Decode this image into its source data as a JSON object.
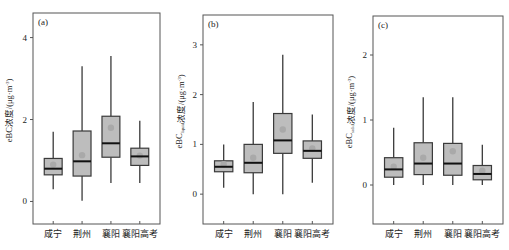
{
  "chart_data": [
    {
      "type": "box",
      "panel_label": "(a)",
      "title": "",
      "xlabel": "",
      "ylabel": "eBC浓度/(μg·m⁻³)",
      "ylabel_main": "eBC",
      "ylabel_sub": "",
      "ylabel_rest": "浓度/(μg·m",
      "ylabel_sup": "-3",
      "ylabel_close": ")",
      "categories": [
        "咸宁",
        "荆州",
        "襄阳",
        "襄阳高考"
      ],
      "yticks": [
        0,
        2,
        4
      ],
      "ylim": [
        -0.55,
        4.6
      ],
      "grid": false,
      "legend": null,
      "boxes": [
        {
          "name": "咸宁",
          "whisker_low": 0.3,
          "q1": 0.65,
          "median": 0.8,
          "q3": 1.05,
          "whisker_high": 1.7,
          "mean": 0.9
        },
        {
          "name": "荆州",
          "whisker_low": 0.02,
          "q1": 0.62,
          "median": 0.98,
          "q3": 1.72,
          "whisker_high": 3.3,
          "mean": 1.13
        },
        {
          "name": "襄阳",
          "whisker_low": 0.45,
          "q1": 1.08,
          "median": 1.42,
          "q3": 2.08,
          "whisker_high": 3.55,
          "mean": 1.8
        },
        {
          "name": "襄阳高考",
          "whisker_low": 0.45,
          "q1": 0.88,
          "median": 1.1,
          "q3": 1.3,
          "whisker_high": 1.97,
          "mean": 1.12
        }
      ]
    },
    {
      "type": "box",
      "panel_label": "(b)",
      "title": "",
      "xlabel": "",
      "ylabel": "eBC_liquid浓度/(μg·m⁻³)",
      "ylabel_main": "eBC",
      "ylabel_sub": "liquid",
      "ylabel_rest": "浓度/(μg·m",
      "ylabel_sup": "-3",
      "ylabel_close": ")",
      "categories": [
        "咸宁",
        "荆州",
        "襄阳",
        "襄阳高考"
      ],
      "yticks": [
        0,
        1,
        2,
        3
      ],
      "ylim": [
        -0.6,
        3.6
      ],
      "grid": false,
      "legend": null,
      "boxes": [
        {
          "name": "咸宁",
          "whisker_low": 0.13,
          "q1": 0.45,
          "median": 0.55,
          "q3": 0.67,
          "whisker_high": 1.0,
          "mean": 0.6
        },
        {
          "name": "荆州",
          "whisker_low": 0.0,
          "q1": 0.43,
          "median": 0.63,
          "q3": 1.0,
          "whisker_high": 1.85,
          "mean": 0.73
        },
        {
          "name": "襄阳",
          "whisker_low": 0.0,
          "q1": 0.82,
          "median": 1.08,
          "q3": 1.62,
          "whisker_high": 2.8,
          "mean": 1.3
        },
        {
          "name": "襄阳高考",
          "whisker_low": 0.23,
          "q1": 0.72,
          "median": 0.87,
          "q3": 1.07,
          "whisker_high": 1.6,
          "mean": 0.92
        }
      ]
    },
    {
      "type": "box",
      "panel_label": "(c)",
      "title": "",
      "xlabel": "",
      "ylabel": "eBC_solid浓度/(μg·m⁻³)",
      "ylabel_main": "eBC",
      "ylabel_sub": "solid",
      "ylabel_rest": "浓度/(μg·m",
      "ylabel_sup": "-3",
      "ylabel_close": ")",
      "categories": [
        "咸宁",
        "荆州",
        "襄阳",
        "襄阳高考"
      ],
      "yticks": [
        0,
        1,
        2
      ],
      "ylim": [
        -0.6,
        2.6
      ],
      "grid": false,
      "legend": null,
      "boxes": [
        {
          "name": "咸宁",
          "whisker_low": 0.0,
          "q1": 0.12,
          "median": 0.24,
          "q3": 0.42,
          "whisker_high": 0.88,
          "mean": 0.28
        },
        {
          "name": "荆州",
          "whisker_low": 0.0,
          "q1": 0.16,
          "median": 0.33,
          "q3": 0.65,
          "whisker_high": 1.35,
          "mean": 0.42
        },
        {
          "name": "襄阳",
          "whisker_low": 0.0,
          "q1": 0.15,
          "median": 0.33,
          "q3": 0.64,
          "whisker_high": 1.35,
          "mean": 0.52
        },
        {
          "name": "襄阳高考",
          "whisker_low": 0.0,
          "q1": 0.08,
          "median": 0.17,
          "q3": 0.3,
          "whisker_high": 0.62,
          "mean": 0.22
        }
      ]
    }
  ],
  "style": {
    "box_fill": "#bdbdbd",
    "box_stroke": "#3a3a3a",
    "median_color": "#111111",
    "mean_marker_color": "#a9a9a9",
    "whisker_color": "#3a3a3a",
    "frame_color": "#555555"
  }
}
